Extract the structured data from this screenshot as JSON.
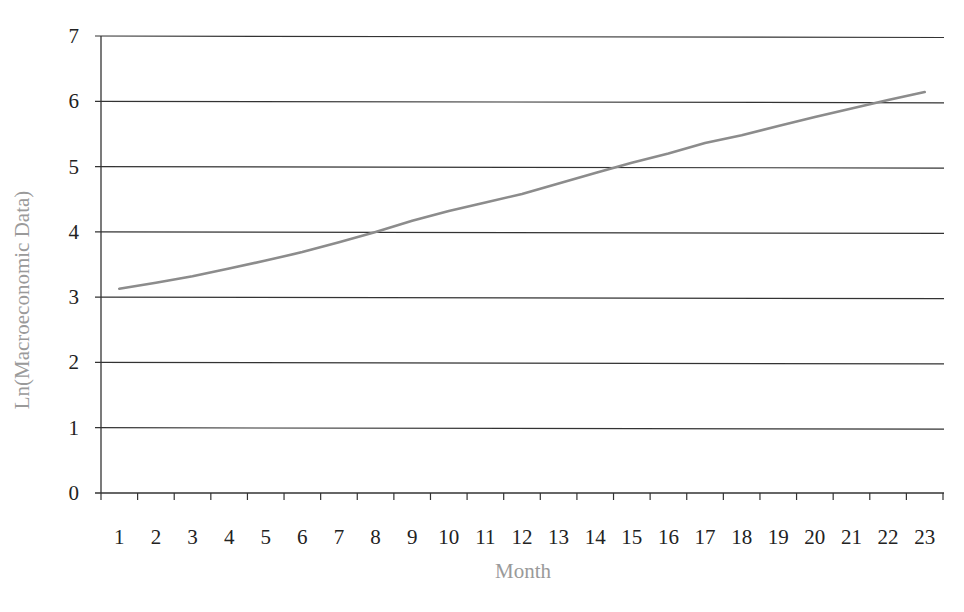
{
  "chart_data": {
    "type": "line",
    "title": "",
    "xlabel": "Month",
    "ylabel": "Ln(Macroeconomic Data)",
    "ylim": [
      0,
      7
    ],
    "yticks": [
      0,
      1,
      2,
      3,
      4,
      5,
      6,
      7
    ],
    "grid": true,
    "legend": null,
    "categories": [
      "1",
      "2",
      "3",
      "4",
      "5",
      "6",
      "7",
      "8",
      "9",
      "10",
      "11",
      "12",
      "13",
      "14",
      "15",
      "16",
      "17",
      "18",
      "19",
      "20",
      "21",
      "22",
      "23"
    ],
    "series": [
      {
        "name": "Ln(Macroeconomic Data)",
        "color": "#8c8c8c",
        "values": [
          3.13,
          3.22,
          3.32,
          3.44,
          3.56,
          3.69,
          3.84,
          4.0,
          4.17,
          4.32,
          4.45,
          4.58,
          4.74,
          4.9,
          5.06,
          5.2,
          5.36,
          5.48,
          5.62,
          5.76,
          5.89,
          6.02,
          6.14
        ]
      }
    ]
  },
  "colors": {
    "gridline": "#333333",
    "axis": "#333333",
    "series": "#8c8c8c",
    "axis_title": "#9a9a9a",
    "tick_label": "#222222"
  }
}
